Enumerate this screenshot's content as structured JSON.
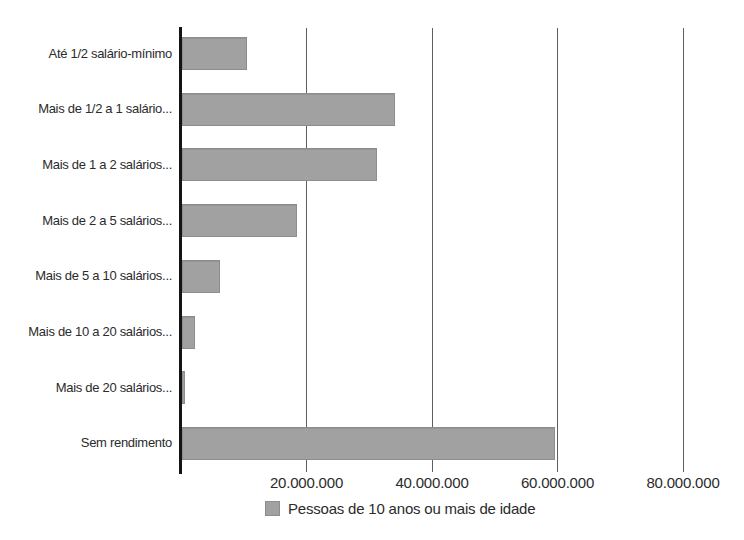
{
  "chart_data": {
    "type": "bar",
    "orientation": "horizontal",
    "categories": [
      "Até 1/2 salário-mínimo",
      "Mais de 1/2 a 1 salário...",
      "Mais de 1 a 2 salários...",
      "Mais de 2 a 5 salários...",
      "Mais de 5 a 10 salários...",
      "Mais de 10 a 20 salários...",
      "Mais de 20 salários...",
      "Sem rendimento"
    ],
    "values": [
      10400000,
      34000000,
      31000000,
      18300000,
      6000000,
      2100000,
      500000,
      59500000
    ],
    "x_axis": {
      "min": 0,
      "max": 80000000,
      "ticks": [
        {
          "value": 20000000,
          "label": "20.000.000"
        },
        {
          "value": 40000000,
          "label": "40.000.000"
        },
        {
          "value": 60000000,
          "label": "60.000.000"
        },
        {
          "value": 80000000,
          "label": "80.000.000"
        }
      ]
    },
    "grid": "vertical",
    "legend": {
      "label": "Pessoas de 10 anos ou mais de idade",
      "position": "bottom"
    },
    "style": {
      "background": "#ffffff",
      "bar_fill": "#a1a1a1",
      "bar_edge": "#8d8d8d",
      "gridline_color": "#5f5f5f",
      "axis_color": "#141414",
      "text_color": "#2b2b2b"
    }
  }
}
